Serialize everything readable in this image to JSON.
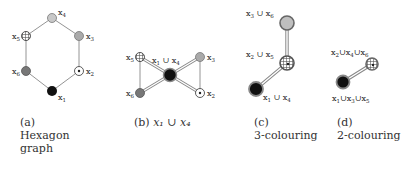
{
  "panels": [
    {
      "id": "a",
      "caption": {
        "tag": "(a)",
        "line1": "Hexagon",
        "line2": "graph"
      },
      "nodes": [
        {
          "label": "x",
          "sub": "4",
          "fill": "light-gray"
        },
        {
          "label": "x",
          "sub": "3",
          "fill": "gray"
        },
        {
          "label": "x",
          "sub": "2",
          "fill": "dotted"
        },
        {
          "label": "x",
          "sub": "1",
          "fill": "black"
        },
        {
          "label": "x",
          "sub": "6",
          "fill": "dark-gray"
        },
        {
          "label": "x",
          "sub": "5",
          "fill": "crosshatch"
        }
      ],
      "edges": [
        [
          "x4",
          "x3"
        ],
        [
          "x3",
          "x2"
        ],
        [
          "x2",
          "x1"
        ],
        [
          "x1",
          "x6"
        ],
        [
          "x6",
          "x5"
        ],
        [
          "x5",
          "x4"
        ]
      ]
    },
    {
      "id": "b",
      "caption": {
        "tag": "(b)",
        "math": "x₁ ∪ x₄"
      },
      "nodes": [
        {
          "label": "x₁∪x₄",
          "fill": "black"
        },
        {
          "label": "x₅",
          "fill": "crosshatch"
        },
        {
          "label": "x₆",
          "fill": "dark-gray"
        },
        {
          "label": "x₃",
          "fill": "gray"
        },
        {
          "label": "x₂",
          "fill": "dotted"
        }
      ],
      "center_label": "x₁ ∪ x₄",
      "labels": {
        "x5": "x₅",
        "x6": "x₆",
        "x3": "x₃",
        "x2": "x₂"
      }
    },
    {
      "id": "c",
      "caption": {
        "tag": "(c)",
        "line1": "3-colouring"
      },
      "labels": {
        "top": "x₃ ∪ x₆",
        "mid": "x₂ ∪ x₅",
        "bottom": "x₁ ∪ x₄"
      }
    },
    {
      "id": "d",
      "caption": {
        "tag": "(d)",
        "line1": "2-colouring"
      },
      "labels": {
        "top": "x₂ ∪ x₄ ∪ x₆",
        "bottom": "x₁ ∪ x₃ ∪ x₅"
      }
    }
  ],
  "colors": {
    "edge": "#888888",
    "black": "#111111",
    "dark_gray": "#777777",
    "gray": "#aaaaaa",
    "light_gray": "#c8c8c8"
  }
}
